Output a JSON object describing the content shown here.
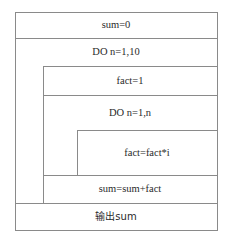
{
  "diagram": {
    "type": "NS structured flowchart",
    "blocks": [
      {
        "id": "init",
        "text": "sum=0"
      },
      {
        "id": "outer_loop",
        "text": "DO n=1,10"
      },
      {
        "id": "fact_init",
        "text": "fact=1"
      },
      {
        "id": "inner_loop",
        "text": "DO n=1,n"
      },
      {
        "id": "fact_mul",
        "text": "fact=fact*i"
      },
      {
        "id": "sum_add",
        "text": "sum=sum+fact"
      },
      {
        "id": "output",
        "text": "输出sum"
      }
    ],
    "colors": {
      "line": "#8a8a8a",
      "text": "#2a2a2a",
      "background": "#ffffff"
    }
  }
}
